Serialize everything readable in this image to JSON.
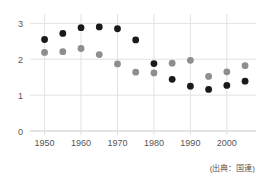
{
  "chart_data": {
    "type": "scatter",
    "title": "",
    "subtitle": "",
    "xlabel": "",
    "ylabel": "",
    "xlim": [
      1946,
      2008
    ],
    "ylim": [
      0,
      3.15
    ],
    "grid": true,
    "legend": false,
    "annotations": [
      "(出典：国連)"
    ],
    "xticks": [
      1950,
      1960,
      1970,
      1980,
      1990,
      2000
    ],
    "xtick_labels": [
      "1950",
      "1960",
      "1970",
      "1980",
      "1990",
      "2000"
    ],
    "yticks": [
      0,
      1,
      2,
      3
    ],
    "ytick_labels": [
      "0",
      "1",
      "2",
      "3"
    ],
    "x": [
      1950,
      1955,
      1960,
      1965,
      1970,
      1975,
      1980,
      1985,
      1990,
      1995,
      2000,
      2005
    ],
    "series": [
      {
        "name": "dark-series",
        "color": "#1a1a1a",
        "values": [
          2.55,
          2.72,
          2.88,
          2.9,
          2.85,
          2.54,
          1.88,
          1.44,
          1.25,
          1.16,
          1.27,
          1.39
        ]
      },
      {
        "name": "gray-series",
        "color": "#8e8e8e",
        "values": [
          2.19,
          2.21,
          2.3,
          2.13,
          1.87,
          1.64,
          1.62,
          1.89,
          1.97,
          1.52,
          1.65,
          1.82
        ]
      }
    ]
  },
  "source_note": "(出典：国連)",
  "style": {
    "grid_color": "#e2e2e2",
    "axis_color": "#c9c9c9",
    "tick_text_color": "#555555",
    "background": "#ffffff"
  }
}
